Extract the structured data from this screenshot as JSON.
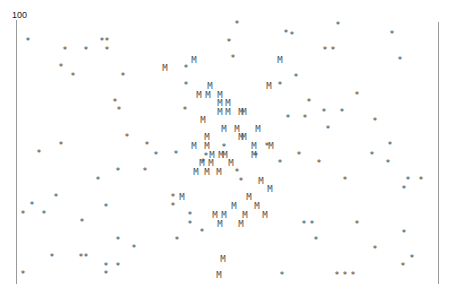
{
  "chart_data": {
    "type": "scatter",
    "title": "",
    "xlabel": "",
    "ylabel": "",
    "ylim": [
      0,
      100
    ],
    "y_tick_labels": [
      "100"
    ],
    "grid": false,
    "legend": null,
    "marker_legend": {
      "*": "star marker",
      "M": "M marker"
    },
    "colors": {
      "axis": "#9a9a9a",
      "marker": "#555555",
      "text": "#222222"
    },
    "series": [
      {
        "name": "star",
        "marker": "*",
        "points_px": [
          [
            28,
            41
          ],
          [
            237,
            24
          ],
          [
            292,
            35
          ],
          [
            338,
            25
          ],
          [
            392,
            34
          ],
          [
            102,
            41
          ],
          [
            107,
            41
          ],
          [
            65,
            50
          ],
          [
            86,
            50
          ],
          [
            107,
            50
          ],
          [
            229,
            42
          ],
          [
            325,
            50
          ],
          [
            333,
            50
          ],
          [
            61,
            67
          ],
          [
            73,
            76
          ],
          [
            123,
            76
          ],
          [
            186,
            68
          ],
          [
            233,
            58
          ],
          [
            286,
            33
          ],
          [
            400,
            60
          ],
          [
            186,
            85
          ],
          [
            296,
            77
          ],
          [
            280,
            85
          ],
          [
            309,
            102
          ],
          [
            357,
            95
          ],
          [
            115,
            102
          ],
          [
            119,
            110
          ],
          [
            288,
            118
          ],
          [
            305,
            118
          ],
          [
            324,
            112
          ],
          [
            342,
            112
          ],
          [
            127,
            137
          ],
          [
            147,
            145
          ],
          [
            156,
            155
          ],
          [
            176,
            154
          ],
          [
            224,
            147
          ],
          [
            267,
            146
          ],
          [
            299,
            155
          ],
          [
            328,
            129
          ],
          [
            375,
            121
          ],
          [
            39,
            153
          ],
          [
            61,
            145
          ],
          [
            185,
            110
          ],
          [
            206,
            156
          ],
          [
            256,
            156
          ],
          [
            280,
            163
          ],
          [
            319,
            163
          ],
          [
            372,
            155
          ],
          [
            390,
            145
          ],
          [
            98,
            180
          ],
          [
            118,
            171
          ],
          [
            145,
            171
          ],
          [
            203,
            162
          ],
          [
            241,
            181
          ],
          [
            237,
            172
          ],
          [
            345,
            180
          ],
          [
            388,
            163
          ],
          [
            408,
            180
          ],
          [
            421,
            180
          ],
          [
            404,
            189
          ],
          [
            32,
            205
          ],
          [
            23,
            214
          ],
          [
            44,
            214
          ],
          [
            56,
            197
          ],
          [
            82,
            222
          ],
          [
            106,
            207
          ],
          [
            173,
            197
          ],
          [
            173,
            206
          ],
          [
            190,
            215
          ],
          [
            190,
            224
          ],
          [
            202,
            232
          ],
          [
            118,
            240
          ],
          [
            81,
            257
          ],
          [
            52,
            257
          ],
          [
            134,
            248
          ],
          [
            177,
            240
          ],
          [
            304,
            224
          ],
          [
            312,
            224
          ],
          [
            357,
            224
          ],
          [
            404,
            233
          ],
          [
            86,
            257
          ],
          [
            106,
            266
          ],
          [
            118,
            266
          ],
          [
            403,
            266
          ],
          [
            412,
            258
          ],
          [
            316,
            240
          ],
          [
            375,
            249
          ],
          [
            23,
            274
          ],
          [
            106,
            274
          ],
          [
            282,
            275
          ],
          [
            337,
            275
          ],
          [
            345,
            275
          ],
          [
            353,
            275
          ]
        ]
      },
      {
        "name": "M",
        "marker": "M",
        "points_px": [
          [
            165,
            68
          ],
          [
            194,
            60
          ],
          [
            280,
            60
          ],
          [
            210,
            86
          ],
          [
            269,
            86
          ],
          [
            199,
            95
          ],
          [
            208,
            95
          ],
          [
            220,
            95
          ],
          [
            220,
            103
          ],
          [
            228,
            103
          ],
          [
            220,
            112
          ],
          [
            228,
            112
          ],
          [
            241,
            112
          ],
          [
            244,
            112
          ],
          [
            203,
            120
          ],
          [
            224,
            129
          ],
          [
            237,
            129
          ],
          [
            258,
            129
          ],
          [
            207,
            137
          ],
          [
            241,
            137
          ],
          [
            244,
            137
          ],
          [
            194,
            146
          ],
          [
            207,
            146
          ],
          [
            254,
            146
          ],
          [
            271,
            146
          ],
          [
            212,
            155
          ],
          [
            221,
            155
          ],
          [
            225,
            155
          ],
          [
            254,
            155
          ],
          [
            202,
            163
          ],
          [
            211,
            163
          ],
          [
            231,
            163
          ],
          [
            196,
            172
          ],
          [
            207,
            172
          ],
          [
            219,
            172
          ],
          [
            261,
            181
          ],
          [
            270,
            189
          ],
          [
            182,
            197
          ],
          [
            249,
            197
          ],
          [
            234,
            206
          ],
          [
            257,
            206
          ],
          [
            215,
            215
          ],
          [
            224,
            215
          ],
          [
            245,
            215
          ],
          [
            265,
            215
          ],
          [
            220,
            224
          ],
          [
            241,
            224
          ],
          [
            223,
            259
          ],
          [
            219,
            275
          ]
        ]
      }
    ]
  },
  "axis": {
    "y_top_label": "100"
  }
}
